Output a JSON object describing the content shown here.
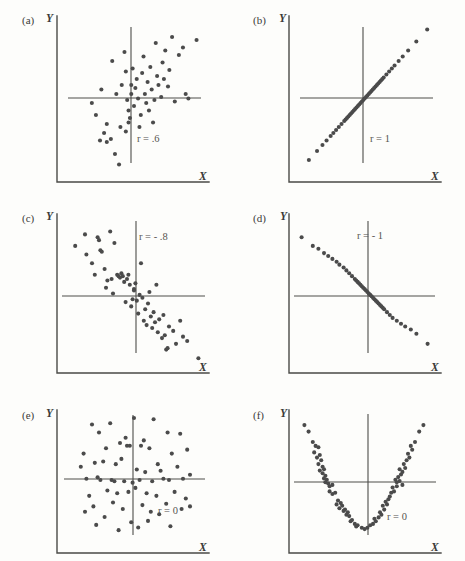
{
  "figure": {
    "background_color": "#fdfdfb",
    "dot_color": "#4b4b4b",
    "line_color": "#4a4a47",
    "y_axis_label": "Y",
    "x_axis_label": "X"
  },
  "chart_data": [
    {
      "type": "scatter",
      "panel": "(a)",
      "title": "",
      "annotation": "r = .6",
      "r": 0.6,
      "xlabel": "X",
      "ylabel": "Y",
      "grid": false,
      "legend": "none",
      "xlim": [
        0,
        100
      ],
      "ylim": [
        0,
        100
      ],
      "mean_x": 50,
      "mean_y": 50,
      "points": [
        [
          26,
          55
        ],
        [
          34,
          74
        ],
        [
          30,
          32
        ],
        [
          28,
          26
        ],
        [
          25,
          21
        ],
        [
          30,
          20
        ],
        [
          33,
          22
        ],
        [
          22,
          38
        ],
        [
          19,
          46
        ],
        [
          36,
          12
        ],
        [
          40,
          30
        ],
        [
          39,
          5
        ],
        [
          44,
          27
        ],
        [
          46,
          33
        ],
        [
          47,
          36
        ],
        [
          46,
          41
        ],
        [
          45,
          48
        ],
        [
          48,
          52
        ],
        [
          48,
          58
        ],
        [
          44,
          67
        ],
        [
          43,
          80
        ],
        [
          50,
          44
        ],
        [
          51,
          56
        ],
        [
          52,
          62
        ],
        [
          53,
          49
        ],
        [
          55,
          38
        ],
        [
          56,
          66
        ],
        [
          57,
          77
        ],
        [
          58,
          52
        ],
        [
          59,
          46
        ],
        [
          60,
          60
        ],
        [
          62,
          70
        ],
        [
          63,
          55
        ],
        [
          64,
          33
        ],
        [
          65,
          48
        ],
        [
          66,
          86
        ],
        [
          67,
          64
        ],
        [
          68,
          58
        ],
        [
          70,
          50
        ],
        [
          71,
          73
        ],
        [
          73,
          81
        ],
        [
          75,
          57
        ],
        [
          76,
          68
        ],
        [
          78,
          90
        ],
        [
          80,
          47
        ],
        [
          83,
          78
        ],
        [
          86,
          83
        ],
        [
          88,
          52
        ],
        [
          90,
          49
        ],
        [
          96,
          88
        ],
        [
          41,
          58
        ],
        [
          49,
          69
        ],
        [
          37,
          52
        ],
        [
          54,
          30
        ],
        [
          61,
          41
        ],
        [
          72,
          62
        ]
      ]
    },
    {
      "type": "scatter",
      "panel": "(b)",
      "title": "",
      "annotation": "r = 1",
      "r": 1,
      "xlabel": "X",
      "ylabel": "Y",
      "grid": false,
      "legend": "none",
      "xlim": [
        0,
        100
      ],
      "ylim": [
        0,
        100
      ],
      "mean_x": 50,
      "mean_y": 50,
      "points": [
        [
          8,
          8
        ],
        [
          14,
          14
        ],
        [
          18,
          18
        ],
        [
          21,
          21
        ],
        [
          24,
          24
        ],
        [
          26,
          26
        ],
        [
          28,
          28
        ],
        [
          30,
          30
        ],
        [
          32,
          32
        ],
        [
          34,
          34
        ],
        [
          35,
          35
        ],
        [
          36,
          36
        ],
        [
          37,
          37
        ],
        [
          38,
          38
        ],
        [
          39,
          39
        ],
        [
          40,
          40
        ],
        [
          41,
          41
        ],
        [
          42,
          42
        ],
        [
          43,
          43
        ],
        [
          44,
          44
        ],
        [
          45,
          45
        ],
        [
          46,
          46
        ],
        [
          47,
          47
        ],
        [
          48,
          48
        ],
        [
          49,
          49
        ],
        [
          50,
          50
        ],
        [
          51,
          51
        ],
        [
          52,
          52
        ],
        [
          53,
          53
        ],
        [
          54,
          54
        ],
        [
          55,
          55
        ],
        [
          56,
          56
        ],
        [
          57,
          57
        ],
        [
          58,
          58
        ],
        [
          59,
          59
        ],
        [
          60,
          60
        ],
        [
          61,
          61
        ],
        [
          62,
          62
        ],
        [
          63,
          63
        ],
        [
          65,
          65
        ],
        [
          67,
          67
        ],
        [
          69,
          69
        ],
        [
          71,
          71
        ],
        [
          74,
          74
        ],
        [
          77,
          77
        ],
        [
          81,
          81
        ],
        [
          87,
          87
        ],
        [
          95,
          95
        ]
      ]
    },
    {
      "type": "scatter",
      "panel": "(c)",
      "title": "",
      "annotation": "r = - .8",
      "r": -0.8,
      "xlabel": "X",
      "ylabel": "Y",
      "grid": false,
      "legend": "none",
      "xlim": [
        0,
        100
      ],
      "ylim": [
        0,
        100
      ],
      "mean_x": 50,
      "mean_y": 50,
      "points": [
        [
          8,
          82
        ],
        [
          15,
          90
        ],
        [
          16,
          76
        ],
        [
          20,
          70
        ],
        [
          22,
          62
        ],
        [
          24,
          88
        ],
        [
          25,
          86
        ],
        [
          26,
          79
        ],
        [
          27,
          78
        ],
        [
          29,
          66
        ],
        [
          31,
          58
        ],
        [
          33,
          92
        ],
        [
          34,
          59
        ],
        [
          36,
          84
        ],
        [
          38,
          62
        ],
        [
          39,
          61
        ],
        [
          40,
          60
        ],
        [
          41,
          63
        ],
        [
          42,
          61
        ],
        [
          43,
          57
        ],
        [
          44,
          43
        ],
        [
          45,
          59
        ],
        [
          46,
          62
        ],
        [
          47,
          55
        ],
        [
          48,
          40
        ],
        [
          49,
          45
        ],
        [
          50,
          52
        ],
        [
          50,
          51
        ],
        [
          51,
          56
        ],
        [
          52,
          44
        ],
        [
          53,
          35
        ],
        [
          54,
          48
        ],
        [
          55,
          70
        ],
        [
          56,
          46
        ],
        [
          57,
          30
        ],
        [
          58,
          38
        ],
        [
          59,
          27
        ],
        [
          60,
          42
        ],
        [
          61,
          50
        ],
        [
          62,
          33
        ],
        [
          63,
          25
        ],
        [
          64,
          36
        ],
        [
          65,
          29
        ],
        [
          66,
          55
        ],
        [
          67,
          22
        ],
        [
          68,
          31
        ],
        [
          70,
          18
        ],
        [
          71,
          34
        ],
        [
          72,
          20
        ],
        [
          73,
          10
        ],
        [
          74,
          11
        ],
        [
          75,
          26
        ],
        [
          78,
          23
        ],
        [
          80,
          14
        ],
        [
          83,
          30
        ],
        [
          85,
          19
        ],
        [
          88,
          16
        ],
        [
          96,
          4
        ],
        [
          30,
          53
        ],
        [
          35,
          49
        ]
      ]
    },
    {
      "type": "scatter",
      "panel": "(d)",
      "title": "",
      "annotation": "r = - 1",
      "r": -1,
      "xlabel": "X",
      "ylabel": "Y",
      "grid": false,
      "legend": "none",
      "xlim": [
        0,
        100
      ],
      "ylim": [
        0,
        100
      ],
      "mean_x": 50,
      "mean_y": 50,
      "points": [
        [
          4,
          88
        ],
        [
          12,
          82
        ],
        [
          16,
          80
        ],
        [
          20,
          77
        ],
        [
          23,
          75
        ],
        [
          26,
          73
        ],
        [
          29,
          71
        ],
        [
          31,
          69
        ],
        [
          34,
          67
        ],
        [
          36,
          65
        ],
        [
          38,
          63
        ],
        [
          40,
          61
        ],
        [
          42,
          59
        ],
        [
          43,
          58
        ],
        [
          44,
          57
        ],
        [
          45,
          56
        ],
        [
          46,
          55
        ],
        [
          47,
          54
        ],
        [
          48,
          53
        ],
        [
          49,
          52
        ],
        [
          50,
          51
        ],
        [
          51,
          50
        ],
        [
          52,
          49
        ],
        [
          53,
          48
        ],
        [
          54,
          47
        ],
        [
          55,
          46
        ],
        [
          56,
          45
        ],
        [
          57,
          44
        ],
        [
          58,
          43
        ],
        [
          59,
          42
        ],
        [
          60,
          41
        ],
        [
          61,
          40
        ],
        [
          62,
          39
        ],
        [
          63,
          38
        ],
        [
          65,
          36
        ],
        [
          67,
          34
        ],
        [
          69,
          32
        ],
        [
          72,
          30
        ],
        [
          75,
          28
        ],
        [
          78,
          26
        ],
        [
          82,
          24
        ],
        [
          86,
          21
        ],
        [
          94,
          14
        ]
      ]
    },
    {
      "type": "scatter",
      "panel": "(e)",
      "title": "",
      "annotation": "r = 0",
      "r": 0,
      "xlabel": "X",
      "ylabel": "Y",
      "grid": false,
      "legend": "none",
      "xlim": [
        0,
        100
      ],
      "ylim": [
        0,
        100
      ],
      "mean_x": 50,
      "mean_y": 50,
      "points": [
        [
          20,
          92
        ],
        [
          33,
          93
        ],
        [
          50,
          97
        ],
        [
          64,
          96
        ],
        [
          25,
          86
        ],
        [
          44,
          82
        ],
        [
          57,
          80
        ],
        [
          74,
          86
        ],
        [
          83,
          85
        ],
        [
          14,
          70
        ],
        [
          30,
          74
        ],
        [
          40,
          78
        ],
        [
          45,
          76
        ],
        [
          47,
          76
        ],
        [
          55,
          76
        ],
        [
          61,
          74
        ],
        [
          77,
          70
        ],
        [
          88,
          73
        ],
        [
          12,
          60
        ],
        [
          22,
          63
        ],
        [
          28,
          64
        ],
        [
          37,
          62
        ],
        [
          41,
          66
        ],
        [
          52,
          58
        ],
        [
          58,
          56
        ],
        [
          67,
          62
        ],
        [
          69,
          57
        ],
        [
          81,
          60
        ],
        [
          90,
          54
        ],
        [
          16,
          51
        ],
        [
          24,
          52
        ],
        [
          26,
          50
        ],
        [
          34,
          50
        ],
        [
          36,
          49
        ],
        [
          43,
          49
        ],
        [
          49,
          48
        ],
        [
          54,
          50
        ],
        [
          63,
          49
        ],
        [
          71,
          51
        ],
        [
          75,
          50
        ],
        [
          85,
          51
        ],
        [
          18,
          38
        ],
        [
          31,
          42
        ],
        [
          38,
          40
        ],
        [
          46,
          41
        ],
        [
          51,
          44
        ],
        [
          59,
          40
        ],
        [
          66,
          38
        ],
        [
          79,
          41
        ],
        [
          87,
          36
        ],
        [
          21,
          30
        ],
        [
          35,
          33
        ],
        [
          42,
          28
        ],
        [
          56,
          31
        ],
        [
          62,
          26
        ],
        [
          73,
          32
        ],
        [
          84,
          28
        ],
        [
          15,
          26
        ],
        [
          29,
          22
        ],
        [
          48,
          18
        ],
        [
          60,
          19
        ],
        [
          68,
          24
        ],
        [
          90,
          30
        ],
        [
          53,
          14
        ],
        [
          23,
          16
        ],
        [
          39,
          12
        ],
        [
          76,
          15
        ]
      ]
    },
    {
      "type": "scatter",
      "panel": "(f)",
      "title": "",
      "annotation": "r = 0",
      "r": 0,
      "xlabel": "X",
      "ylabel": "Y",
      "grid": false,
      "legend": "none",
      "xlim": [
        0,
        100
      ],
      "ylim": [
        0,
        100
      ],
      "mean_x": 50,
      "mean_y": 50,
      "points": [
        [
          6,
          93
        ],
        [
          9,
          88
        ],
        [
          12,
          80
        ],
        [
          14,
          77
        ],
        [
          16,
          76
        ],
        [
          13,
          72
        ],
        [
          17,
          70
        ],
        [
          15,
          68
        ],
        [
          18,
          66
        ],
        [
          16,
          63
        ],
        [
          19,
          61
        ],
        [
          17,
          58
        ],
        [
          20,
          59
        ],
        [
          19,
          56
        ],
        [
          21,
          54
        ],
        [
          20,
          52
        ],
        [
          22,
          51
        ],
        [
          21,
          49
        ],
        [
          23,
          48
        ],
        [
          24,
          42
        ],
        [
          26,
          40
        ],
        [
          28,
          41
        ],
        [
          30,
          35
        ],
        [
          32,
          33
        ],
        [
          29,
          32
        ],
        [
          33,
          31
        ],
        [
          31,
          29
        ],
        [
          35,
          28
        ],
        [
          34,
          27
        ],
        [
          37,
          26
        ],
        [
          36,
          24
        ],
        [
          38,
          23
        ],
        [
          40,
          20
        ],
        [
          39,
          19
        ],
        [
          42,
          17
        ],
        [
          44,
          16
        ],
        [
          43,
          15
        ],
        [
          47,
          14
        ],
        [
          49,
          13
        ],
        [
          51,
          14
        ],
        [
          53,
          16
        ],
        [
          55,
          17
        ],
        [
          57,
          19
        ],
        [
          56,
          21
        ],
        [
          59,
          22
        ],
        [
          61,
          24
        ],
        [
          60,
          26
        ],
        [
          63,
          28
        ],
        [
          62,
          31
        ],
        [
          65,
          32
        ],
        [
          64,
          34
        ],
        [
          66,
          36
        ],
        [
          67,
          38
        ],
        [
          68,
          41
        ],
        [
          70,
          42
        ],
        [
          69,
          45
        ],
        [
          72,
          49
        ],
        [
          71,
          51
        ],
        [
          74,
          50
        ],
        [
          73,
          53
        ],
        [
          75,
          55
        ],
        [
          76,
          57
        ],
        [
          74,
          59
        ],
        [
          78,
          60
        ],
        [
          77,
          63
        ],
        [
          79,
          66
        ],
        [
          81,
          68
        ],
        [
          80,
          71
        ],
        [
          83,
          74
        ],
        [
          82,
          77
        ],
        [
          85,
          80
        ],
        [
          88,
          88
        ],
        [
          91,
          93
        ],
        [
          26,
          47
        ],
        [
          76,
          47
        ],
        [
          72,
          46
        ],
        [
          24,
          46
        ]
      ]
    }
  ]
}
